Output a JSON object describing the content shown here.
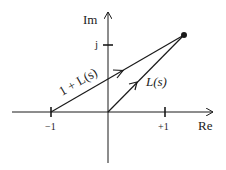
{
  "diagram": {
    "axes": {
      "x_label": "Re",
      "y_label": "Im",
      "x_ticks": [
        {
          "value": -1,
          "label": "−1"
        },
        {
          "value": 1,
          "label": "+1"
        }
      ],
      "y_ticks": [
        {
          "value": 1,
          "label": "j"
        }
      ]
    },
    "point": {
      "re": 1.35,
      "im": 1.2
    },
    "vectors": [
      {
        "from": "-1",
        "to": "point",
        "label": "1 + L(s)"
      },
      {
        "from": "origin",
        "to": "point",
        "label": "L(s)"
      }
    ],
    "colors": {
      "line": "#1a1a1a",
      "background": "#ffffff"
    }
  }
}
